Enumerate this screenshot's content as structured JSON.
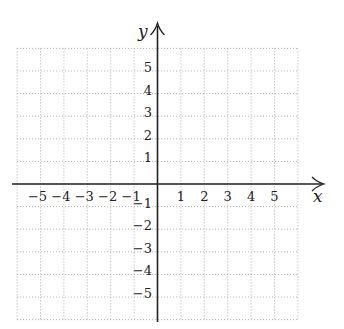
{
  "chart_data": {
    "type": "scatter",
    "title": "",
    "xlabel": "x",
    "ylabel": "y",
    "xlim": [
      -6,
      6
    ],
    "ylim": [
      -6,
      6
    ],
    "grid": true,
    "grid_style": "dotted",
    "x_ticks": [
      -5,
      -4,
      -3,
      -2,
      -1,
      1,
      2,
      3,
      4,
      5
    ],
    "y_ticks": [
      5,
      4,
      3,
      2,
      1,
      -1,
      -2,
      -3,
      -4,
      -5
    ],
    "x_tick_labels": [
      "−5",
      "−4",
      "−3",
      "−2",
      "−1",
      "1",
      "2",
      "3",
      "4",
      "5"
    ],
    "y_tick_labels": [
      "5",
      "4",
      "3",
      "2",
      "1",
      "−1",
      "−2",
      "−3",
      "−4",
      "−5"
    ],
    "series": [],
    "legend": null
  },
  "colors": {
    "axis": "#222222",
    "grid": "#9a9a9a",
    "background": "#ffffff"
  }
}
